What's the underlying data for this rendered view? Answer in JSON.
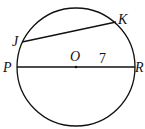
{
  "diagram": {
    "center_label": "O",
    "points": {
      "J": "J",
      "K": "K",
      "P": "P",
      "R": "R"
    },
    "radius_label": "7"
  },
  "colors": {
    "stroke": "#111111",
    "background": "#ffffff"
  }
}
